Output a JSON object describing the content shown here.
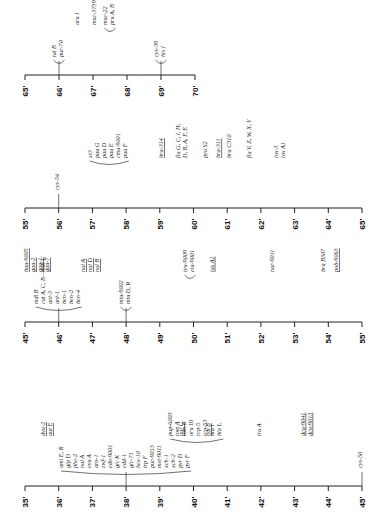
{
  "figure": {
    "type": "genetic-linkage-map",
    "orientation": "rotated-90-ccw",
    "rows": [
      {
        "id": "row-65-70",
        "axis_y": 75,
        "x_start": 25,
        "x_end": 195,
        "ticks": [
          "65'",
          "66'",
          "67'",
          "68'",
          "69'",
          "70'"
        ],
        "loci": [
          {
            "labels": [
              "tal B",
              "pur-70"
            ],
            "tick": 1,
            "bracket": true
          },
          {
            "labels": [
              "oru I"
            ],
            "pos": 1.6
          },
          {
            "labels": [
              "muc-3739"
            ],
            "pos": 2.1
          },
          {
            "labels": [
              "muc-22",
              "pru A, B"
            ],
            "pos": 2.5,
            "bracket": true
          },
          {
            "labels": [
              "cys-39",
              "his I"
            ],
            "tick": 4,
            "bracket": true
          }
        ]
      },
      {
        "id": "row-55-65",
        "axis_y": 208,
        "x_start": 25,
        "x_end": 362,
        "ticks": [
          "55'",
          "56'",
          "57'",
          "58'",
          "59'",
          "60'",
          "61'",
          "62'",
          "63'",
          "64'",
          "65'"
        ],
        "loci": [
          {
            "labels": [
              "cys-54"
            ],
            "tick": 1
          },
          {
            "labels": [
              "sr3",
              "pau G",
              "pau D",
              "pau E",
              "cmu-9001",
              "pau F"
            ],
            "pos": 2.5,
            "bracket": true
          },
          {
            "labels": [
              "bra-314"
            ],
            "pos": 4.1,
            "underline": true
          },
          {
            "labels": [
              "fla G, C, I, H,",
              "D, B, A, F, E"
            ],
            "pos": 4.7
          },
          {
            "labels": [
              "pyo S2"
            ],
            "pos": 5.4
          },
          {
            "labels": [
              "bra-311"
            ],
            "pos": 5.8,
            "underline": true
          },
          {
            "labels": [
              "bra C310"
            ],
            "pos": 6.1
          },
          {
            "labels": [
              "fla V, Z, W, X, Y"
            ],
            "pos": 6.7
          },
          {
            "labels": [
              "lox-3",
              "lox A1"
            ],
            "pos": 7.6
          }
        ]
      },
      {
        "id": "row-45-55",
        "axis_y": 322,
        "x_start": 25,
        "x_end": 362,
        "ticks": [
          "45'",
          "46'",
          "47'",
          "48'",
          "49'",
          "50'",
          "51'",
          "52'",
          "53'",
          "54'",
          "55'"
        ],
        "loci": [
          {
            "labels": [
              "bau-9005",
              "gau-2",
              "gau-1",
              "gau-7"
            ],
            "pos": 0.4,
            "underline": true
          },
          {
            "labels": [
              "mdl B",
              "cat A, C, B—mdl C",
              "ant-3",
              "ant-1",
              "ben-1",
              "ben-2",
              "ben-4"
            ],
            "tick": 1,
            "bracket": true
          },
          {
            "labels": [
              "nal A",
              "nal D",
              "nal B"
            ],
            "pos": 2.0,
            "underline": true
          },
          {
            "labels": [
              "mtu-9002",
              "mtu D, R"
            ],
            "tick": 3,
            "bracket": true
          },
          {
            "labels": [
              "tyu-9009",
              "elu-9001"
            ],
            "pos": 4.9,
            "bracket": true
          },
          {
            "labels": [
              "las A1"
            ],
            "pos": 5.6,
            "underline": true
          },
          {
            "labels": [
              "nar-9011"
            ],
            "pos": 7.4
          },
          {
            "labels": [
              "bra B307"
            ],
            "pos": 8.9
          },
          {
            "labels": [
              "pob-9063"
            ],
            "pos": 9.3,
            "underline": true
          }
        ]
      },
      {
        "id": "row-35-45",
        "axis_y": 486,
        "x_start": 25,
        "x_end": 362,
        "ticks": [
          "35'",
          "36'",
          "37'",
          "38'",
          "39'",
          "40'",
          "41'",
          "42'",
          "43'",
          "44'",
          "45'"
        ],
        "loci": [
          {
            "labels": [
              "dvu-2",
              "aut E"
            ],
            "pos": 0.7,
            "underline": true
          },
          {
            "labels": [
              "ami E, R",
              "glp D",
              "phe-2",
              "nal A",
              "eva A",
              "aro-1",
              "zwf-1",
              "edn-9001",
              "glc K",
              "edd-1",
              "glc-71",
              "hex-10",
              "trp F",
              "pur-9013",
              "met-9011",
              "xch-1",
              "xch-2",
              "pyr D",
              "pyr F"
            ],
            "tick": 3,
            "bracket": true
          },
          {
            "labels": [
              "nal C"
            ],
            "pos": 4.7,
            "underline": true
          },
          {
            "labels": [
              "pup-6003",
              "tom A",
              "tom B",
              "oru III",
              "rcp-5",
              "rcp-53",
              "bla I",
              "bla L"
            ],
            "pos": 5.1,
            "bracket": true
          },
          {
            "labels": [
              "lvu B"
            ],
            "pos": 5.5,
            "underline": true
          },
          {
            "labels": [
              "tra A"
            ],
            "pos": 7.0
          },
          {
            "labels": [
              "dcu-9041",
              "dcu-9013"
            ],
            "pos": 8.4,
            "underline": true
          },
          {
            "labels": [
              "cys-50"
            ],
            "tick": 10
          }
        ]
      }
    ]
  }
}
